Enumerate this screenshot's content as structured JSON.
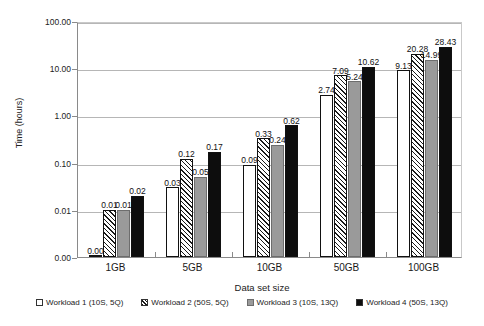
{
  "chart_data": {
    "type": "bar",
    "title": "",
    "subtitle": "",
    "xlabel": "Data set size",
    "ylabel": "Time (hours)",
    "categories": [
      "1GB",
      "5GB",
      "10GB",
      "50GB",
      "100GB"
    ],
    "yscale": "log",
    "ylim": [
      0.0,
      100.0
    ],
    "yticks": [
      100.0,
      10.0,
      1.0,
      0.1,
      0.01,
      0.0
    ],
    "ytick_labels": [
      "100.00",
      "10.00",
      "1.00",
      "0.10",
      "0.01",
      "0.00"
    ],
    "grid": "horizontal",
    "legend_position": "bottom",
    "series": [
      {
        "name": "Workload 1 (10S, 5Q)",
        "fill": "white",
        "color": "#ffffff",
        "values": [
          0.0,
          0.03,
          0.09,
          2.74,
          9.13
        ],
        "labels": [
          "0.00",
          "0.03",
          "0.09",
          "2.74",
          "9.13"
        ]
      },
      {
        "name": "Workload 2 (50S, 5Q)",
        "fill": "diagonal-hatch",
        "color": "#ffffff",
        "values": [
          0.01,
          0.12,
          0.33,
          7.09,
          20.28
        ],
        "labels": [
          "0.01",
          "0.12",
          "0.33",
          "7.09",
          "20.28"
        ]
      },
      {
        "name": "Workload 3 (10S, 13Q)",
        "fill": "gray",
        "color": "#9a9a9a",
        "values": [
          0.01,
          0.05,
          0.24,
          5.24,
          14.99
        ],
        "labels": [
          "0.01",
          "0.05",
          "0.24",
          "5.24",
          "14.99"
        ]
      },
      {
        "name": "Workload 4 (50S, 13Q)",
        "fill": "black",
        "color": "#0d0d0d",
        "values": [
          0.02,
          0.17,
          0.62,
          10.62,
          28.43
        ],
        "labels": [
          "0.02",
          "0.17",
          "0.62",
          "10.62",
          "28.43"
        ]
      }
    ]
  }
}
